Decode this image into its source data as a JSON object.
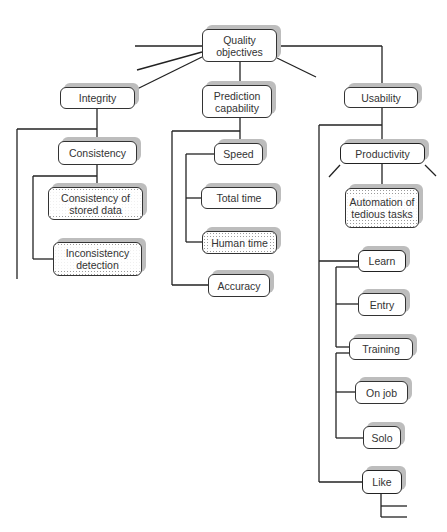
{
  "diagram": {
    "type": "hierarchy-tree",
    "root": {
      "id": "quality-objectives",
      "label": "Quality objectives"
    },
    "nodes": {
      "quality_objectives": {
        "label": "Quality objectives",
        "x": 202,
        "y": 29,
        "w": 75,
        "h": 33,
        "style": "plain"
      },
      "integrity": {
        "label": "Integrity",
        "x": 60,
        "y": 87,
        "w": 75,
        "h": 22,
        "style": "plain"
      },
      "prediction_capability": {
        "label": "Prediction capability",
        "x": 202,
        "y": 85,
        "w": 70,
        "h": 33,
        "style": "plain"
      },
      "usability": {
        "label": "Usability",
        "x": 344,
        "y": 87,
        "w": 74,
        "h": 21,
        "style": "plain"
      },
      "consistency": {
        "label": "Consistency",
        "x": 58,
        "y": 141,
        "w": 79,
        "h": 24,
        "style": "plain"
      },
      "consistency_of_stored_data": {
        "label": "Consistency of stored data",
        "x": 48,
        "y": 187,
        "w": 95,
        "h": 33,
        "style": "dotted"
      },
      "inconsistency_detection": {
        "label": "Inconsistency detection",
        "x": 53,
        "y": 242,
        "w": 89,
        "h": 34,
        "style": "dotted"
      },
      "speed": {
        "label": "Speed",
        "x": 214,
        "y": 143,
        "w": 49,
        "h": 22,
        "style": "plain"
      },
      "total_time": {
        "label": "Total time",
        "x": 201,
        "y": 187,
        "w": 76,
        "h": 22,
        "style": "plain"
      },
      "human_time": {
        "label": "Human time",
        "x": 202,
        "y": 231,
        "w": 75,
        "h": 23,
        "style": "dotted"
      },
      "accuracy": {
        "label": "Accuracy",
        "x": 208,
        "y": 274,
        "w": 62,
        "h": 23,
        "style": "plain"
      },
      "productivity": {
        "label": "Productivity",
        "x": 340,
        "y": 143,
        "w": 85,
        "h": 21,
        "style": "bold"
      },
      "automation_of_tedious_tasks": {
        "label": "Automation of tedious tasks",
        "x": 345,
        "y": 188,
        "w": 74,
        "h": 40,
        "style": "dotted"
      },
      "learn": {
        "label": "Learn",
        "x": 358,
        "y": 250,
        "w": 48,
        "h": 22,
        "style": "bold"
      },
      "entry": {
        "label": "Entry",
        "x": 358,
        "y": 293,
        "w": 48,
        "h": 23,
        "style": "plain"
      },
      "training": {
        "label": "Training",
        "x": 349,
        "y": 338,
        "w": 64,
        "h": 22,
        "style": "plain"
      },
      "on_job": {
        "label": "On job",
        "x": 355,
        "y": 381,
        "w": 53,
        "h": 23,
        "style": "plain"
      },
      "solo": {
        "label": "Solo",
        "x": 363,
        "y": 426,
        "w": 38,
        "h": 23,
        "style": "plain"
      },
      "like": {
        "label": "Like",
        "x": 362,
        "y": 470,
        "w": 40,
        "h": 24,
        "style": "bold"
      }
    },
    "edges": [
      [
        "Quality objectives",
        "Integrity"
      ],
      [
        "Quality objectives",
        "Prediction capability"
      ],
      [
        "Quality objectives",
        "Usability"
      ],
      [
        "Integrity",
        "Consistency"
      ],
      [
        "Consistency",
        "Consistency of stored data"
      ],
      [
        "Consistency",
        "Inconsistency detection"
      ],
      [
        "Prediction capability",
        "Speed"
      ],
      [
        "Speed",
        "Total time"
      ],
      [
        "Speed",
        "Human time"
      ],
      [
        "Prediction capability",
        "Accuracy"
      ],
      [
        "Usability",
        "Productivity"
      ],
      [
        "Productivity",
        "Automation of tedious tasks"
      ],
      [
        "Usability",
        "Learn"
      ],
      [
        "Learn",
        "Entry"
      ],
      [
        "Learn",
        "Training"
      ],
      [
        "Training",
        "On job"
      ],
      [
        "Training",
        "Solo"
      ],
      [
        "Usability",
        "Like"
      ]
    ],
    "legend": {
      "plain": "solid box",
      "bold": "thick outlined box",
      "dotted": "dot-shaded box"
    }
  }
}
